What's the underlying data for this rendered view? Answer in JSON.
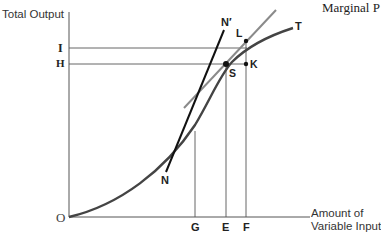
{
  "header": {
    "cropped_title": "Marginal P"
  },
  "axes": {
    "y_label": "Total Output",
    "x_label_line1": "Amount of",
    "x_label_line2": "Variable Input",
    "origin": "O"
  },
  "y_ticks": [
    {
      "label": "I"
    },
    {
      "label": "H"
    }
  ],
  "x_ticks": [
    {
      "label": "G"
    },
    {
      "label": "E"
    },
    {
      "label": "F"
    }
  ],
  "points": {
    "S": "S",
    "K": "K",
    "L": "L"
  },
  "curves": {
    "total_product": "T",
    "steep_line_start": "N",
    "steep_line_end": "N′"
  },
  "colors": {
    "curve": "#444444",
    "tangent_line": "#888888",
    "steep_line": "#111111",
    "axes": "#555555",
    "guides": "#555555"
  }
}
